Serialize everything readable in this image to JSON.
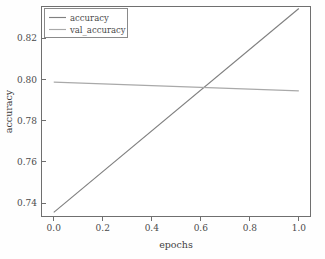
{
  "chart_data": {
    "type": "line",
    "title": "",
    "xlabel": "epochs",
    "ylabel": "accuracy",
    "xlim": [
      -0.05,
      1.05
    ],
    "ylim": [
      0.7335,
      0.8355
    ],
    "grid": false,
    "legend_position": "upper left",
    "x": [
      0.0,
      1.0
    ],
    "xticks": [
      0.0,
      0.2,
      0.4,
      0.6,
      0.8,
      1.0
    ],
    "xticklabels": [
      "0.0",
      "0.2",
      "0.4",
      "0.6",
      "0.8",
      "1.0"
    ],
    "yticks": [
      0.74,
      0.76,
      0.78,
      0.8,
      0.82
    ],
    "yticklabels": [
      "0.74",
      "0.76",
      "0.78",
      "0.80",
      "0.82"
    ],
    "series": [
      {
        "name": "accuracy",
        "color": "#808080",
        "values": [
          0.7355,
          0.8345
        ]
      },
      {
        "name": "val_accuracy",
        "color": "#a9a9a9",
        "values": [
          0.7988,
          0.7945
        ]
      }
    ],
    "annotations": {
      "crossover_epoch": 0.6,
      "crossover_accuracy": 0.7949
    }
  },
  "legend": {
    "entries": [
      {
        "label": "accuracy"
      },
      {
        "label": "val_accuracy"
      }
    ]
  },
  "axes": {
    "x_label": "epochs",
    "y_label": "accuracy",
    "x_tick_0": "0.0",
    "x_tick_1": "0.2",
    "x_tick_2": "0.4",
    "x_tick_3": "0.6",
    "x_tick_4": "0.8",
    "x_tick_5": "1.0",
    "y_tick_0": "0.74",
    "y_tick_1": "0.76",
    "y_tick_2": "0.78",
    "y_tick_3": "0.80",
    "y_tick_4": "0.82"
  },
  "colors": {
    "background": "#fefefe",
    "spine": "#6f6f6f",
    "series_accuracy": "#808080",
    "series_val_accuracy": "#a9a9a9",
    "text": "#4a4a4a"
  }
}
